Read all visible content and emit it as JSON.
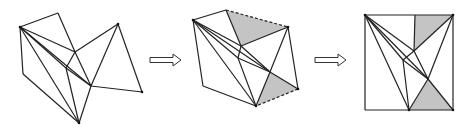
{
  "figure": {
    "colors": {
      "stroke": "#222222",
      "shade": "#c4c4c4",
      "background": "#ffffff"
    },
    "panels": [
      {
        "id": "panel-1",
        "vertices": {
          "A": [
            20,
            27
          ],
          "B": [
            58,
            13
          ],
          "C": [
            75,
            52
          ],
          "D": [
            66,
            68
          ],
          "E": [
            91,
            86
          ],
          "F": [
            118,
            24
          ],
          "G": [
            142,
            92
          ],
          "H": [
            79,
            123
          ],
          "I": [
            23,
            74
          ]
        },
        "edges": [
          [
            "A",
            "B"
          ],
          [
            "B",
            "C"
          ],
          [
            "C",
            "F"
          ],
          [
            "F",
            "G"
          ],
          [
            "G",
            "E"
          ],
          [
            "E",
            "H"
          ],
          [
            "H",
            "I"
          ],
          [
            "I",
            "A"
          ],
          [
            "A",
            "C"
          ],
          [
            "A",
            "E"
          ],
          [
            "A",
            "D"
          ],
          [
            "A",
            "H"
          ],
          [
            "C",
            "D"
          ],
          [
            "C",
            "E"
          ],
          [
            "D",
            "E"
          ],
          [
            "D",
            "H"
          ],
          [
            "F",
            "E"
          ]
        ],
        "shaded": [],
        "dashed": []
      },
      {
        "id": "panel-2",
        "vertices": {
          "A": [
            193,
            20
          ],
          "B": [
            226,
            10
          ],
          "C": [
            241,
            46
          ],
          "D": [
            238,
            58
          ],
          "E": [
            270,
            72
          ],
          "F": [
            288,
            27
          ],
          "G": [
            298,
            89
          ],
          "H": [
            256,
            106
          ],
          "I": [
            203,
            86
          ]
        },
        "edges": [
          [
            "A",
            "B"
          ],
          [
            "B",
            "C"
          ],
          [
            "C",
            "F"
          ],
          [
            "F",
            "G"
          ],
          [
            "G",
            "E"
          ],
          [
            "E",
            "H"
          ],
          [
            "H",
            "I"
          ],
          [
            "I",
            "A"
          ],
          [
            "A",
            "C"
          ],
          [
            "A",
            "E"
          ],
          [
            "A",
            "D"
          ],
          [
            "A",
            "H"
          ],
          [
            "C",
            "D"
          ],
          [
            "C",
            "E"
          ],
          [
            "D",
            "E"
          ],
          [
            "D",
            "H"
          ],
          [
            "F",
            "E"
          ]
        ],
        "shaded": [
          [
            "B",
            "F",
            "C"
          ],
          [
            "E",
            "G",
            "H"
          ]
        ],
        "dashed": [
          [
            "B",
            "F"
          ],
          [
            "G",
            "H"
          ]
        ]
      },
      {
        "id": "panel-3",
        "vertices": {
          "A": [
            365,
            15
          ],
          "B": [
            415,
            15
          ],
          "C": [
            414,
            51
          ],
          "D": [
            403,
            60
          ],
          "E": [
            428,
            79
          ],
          "F": [
            453,
            15
          ],
          "G": [
            453,
            110
          ],
          "H": [
            409,
            110
          ],
          "I": [
            365,
            110
          ]
        },
        "edges": [
          [
            "A",
            "B"
          ],
          [
            "B",
            "C"
          ],
          [
            "C",
            "F"
          ],
          [
            "F",
            "G"
          ],
          [
            "G",
            "E"
          ],
          [
            "E",
            "H"
          ],
          [
            "H",
            "I"
          ],
          [
            "I",
            "A"
          ],
          [
            "A",
            "C"
          ],
          [
            "A",
            "E"
          ],
          [
            "A",
            "D"
          ],
          [
            "A",
            "H"
          ],
          [
            "C",
            "D"
          ],
          [
            "C",
            "E"
          ],
          [
            "D",
            "E"
          ],
          [
            "D",
            "H"
          ],
          [
            "F",
            "E"
          ],
          [
            "B",
            "F"
          ],
          [
            "G",
            "H"
          ]
        ],
        "shaded": [
          [
            "B",
            "F",
            "C"
          ],
          [
            "E",
            "G",
            "H"
          ]
        ],
        "dashed": []
      }
    ],
    "arrows": [
      {
        "id": "arrow-1",
        "x1": 150,
        "x2": 181,
        "y": 60
      },
      {
        "id": "arrow-2",
        "x1": 315,
        "x2": 346,
        "y": 60
      }
    ]
  }
}
